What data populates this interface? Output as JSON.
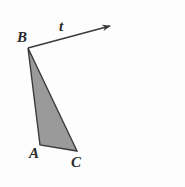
{
  "figure": {
    "kind": "geometry-diagram",
    "background_color": "#fdfdfd",
    "stroke_color": "#3a3a3a",
    "fill_color": "#9a9a9a",
    "labels": {
      "vertex_b": "B",
      "vertex_a": "A",
      "vertex_c": "C",
      "ray_t": "t"
    },
    "geometry": {
      "triangle_points": "28,48 40,145 77,151",
      "ray_start": {
        "x": 28,
        "y": 48
      },
      "ray_end": {
        "x": 112,
        "y": 25
      }
    }
  }
}
